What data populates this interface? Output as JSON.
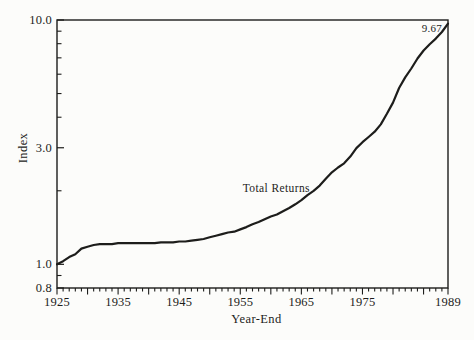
{
  "figure": {
    "background_color": "#fcfcfa",
    "ink_color": "#1d1d1b"
  },
  "chart_data": {
    "type": "line",
    "title": "",
    "xlabel": "Year-End",
    "ylabel": "Index",
    "x_scale": "linear",
    "y_scale": "log",
    "xlim": [
      1925,
      1989
    ],
    "ylim": [
      0.8,
      10.0
    ],
    "grid": false,
    "legend_position": "inline-label-on-curve",
    "y_major_ticks": [
      10.0,
      3.0,
      1.0,
      0.8
    ],
    "y_major_tick_labels": [
      "10.0",
      "3.0",
      "1.0",
      "0.8"
    ],
    "y_minor_ticks": [
      9,
      8,
      7,
      6,
      5,
      4,
      2,
      0.9
    ],
    "x_major_tick_years": [
      1925,
      1930,
      1935,
      1940,
      1945,
      1950,
      1955,
      1960,
      1965,
      1970,
      1975,
      1980,
      1985,
      1989
    ],
    "x_minor_tick_interval_years": 1,
    "x_labeled_ticks": [
      {
        "year": 1925,
        "label": "1925"
      },
      {
        "year": 1935,
        "label": "1935"
      },
      {
        "year": 1945,
        "label": "1945"
      },
      {
        "year": 1955,
        "label": "1955"
      },
      {
        "year": 1965,
        "label": "1965"
      },
      {
        "year": 1975,
        "label": "1975"
      },
      {
        "year": 1989,
        "label": "1989"
      }
    ],
    "series": [
      {
        "name": "Total Returns",
        "inline_label": "Total Returns",
        "end_value_label": "9.67",
        "x": [
          1925,
          1926,
          1927,
          1928,
          1929,
          1930,
          1931,
          1932,
          1933,
          1934,
          1935,
          1936,
          1937,
          1938,
          1939,
          1940,
          1941,
          1942,
          1943,
          1944,
          1945,
          1946,
          1947,
          1948,
          1949,
          1950,
          1951,
          1952,
          1953,
          1954,
          1955,
          1956,
          1957,
          1958,
          1959,
          1960,
          1961,
          1962,
          1963,
          1964,
          1965,
          1966,
          1967,
          1968,
          1969,
          1970,
          1971,
          1972,
          1973,
          1974,
          1975,
          1976,
          1977,
          1978,
          1979,
          1980,
          1981,
          1982,
          1983,
          1984,
          1985,
          1986,
          1987,
          1988,
          1989
        ],
        "values": [
          1.0,
          1.03,
          1.07,
          1.1,
          1.16,
          1.18,
          1.2,
          1.21,
          1.21,
          1.21,
          1.22,
          1.22,
          1.22,
          1.22,
          1.22,
          1.22,
          1.22,
          1.23,
          1.23,
          1.23,
          1.24,
          1.24,
          1.25,
          1.26,
          1.27,
          1.29,
          1.31,
          1.33,
          1.35,
          1.36,
          1.39,
          1.42,
          1.46,
          1.49,
          1.53,
          1.57,
          1.6,
          1.65,
          1.7,
          1.76,
          1.83,
          1.92,
          2.0,
          2.1,
          2.24,
          2.38,
          2.49,
          2.59,
          2.76,
          2.99,
          3.16,
          3.32,
          3.49,
          3.74,
          4.13,
          4.59,
          5.27,
          5.82,
          6.33,
          6.96,
          7.5,
          7.96,
          8.39,
          8.93,
          9.67
        ]
      }
    ],
    "annotations": [
      {
        "id": "series-label",
        "text": "Total Returns",
        "year": 1960.9,
        "value": 1.98,
        "anchor": "middle"
      },
      {
        "id": "end-value-label",
        "text": "9.67",
        "year": 1988.0,
        "value": 8.93,
        "anchor": "end"
      }
    ]
  }
}
